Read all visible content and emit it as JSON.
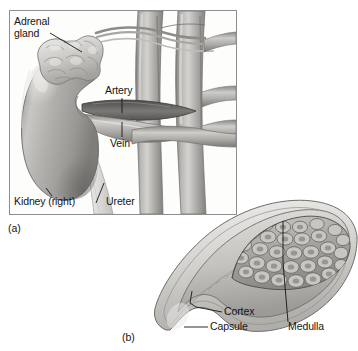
{
  "figure": {
    "background_color": "#ffffff",
    "panels": [
      {
        "tag": "(a)",
        "caption": "Gross anatomy of right kidney with adrenal gland and great vessels",
        "framed": true,
        "frame_color": "#8e8e8e",
        "labels": [
          {
            "name": "adrenal-gland",
            "text": "Adrenal\ngland"
          },
          {
            "name": "artery",
            "text": "Artery"
          },
          {
            "name": "vein",
            "text": "Vein"
          },
          {
            "name": "kidney-right",
            "text": "Kidney (right)"
          },
          {
            "name": "ureter",
            "text": "Ureter"
          }
        ]
      },
      {
        "tag": "(b)",
        "caption": "Sectional view of adrenal gland showing capsule, cortex and medulla",
        "framed": false,
        "labels": [
          {
            "name": "cortex",
            "text": "Cortex"
          },
          {
            "name": "capsule",
            "text": "Capsule"
          },
          {
            "name": "medulla",
            "text": "Medulla"
          }
        ]
      }
    ]
  },
  "panel_a": {
    "tag": "(a)",
    "label_adrenal_line1": "Adrenal",
    "label_adrenal_line2": "gland",
    "label_artery": "Artery",
    "label_vein": "Vein",
    "label_kidney": "Kidney (right)",
    "label_ureter": "Ureter"
  },
  "panel_b": {
    "tag": "(b)",
    "label_cortex": "Cortex",
    "label_capsule": "Capsule",
    "label_medulla": "Medulla"
  },
  "colors": {
    "background": "#ffffff",
    "frame_border": "#8e8e8e",
    "kidney_body": "#a9a7a4",
    "kidney_highlight": "#d6d4d1",
    "kidney_shadow": "#7c7a77",
    "adrenal_gland": "#cfcdc9",
    "adrenal_shadow": "#96948f",
    "vessel_body": "#b4b2af",
    "vessel_shadow": "#7e7c79",
    "ureter": "#e9e8e6",
    "gland_capsule": "#d9d7d4",
    "gland_cortex": "#c2c0bd",
    "gland_medulla": "#9b9996",
    "leader_line": "#141414",
    "text": "#141414"
  }
}
